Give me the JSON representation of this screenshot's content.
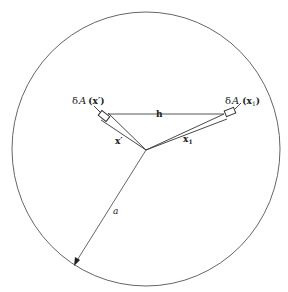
{
  "diagram": {
    "colors": {
      "stroke": "#555555",
      "text": "#222222",
      "background": "#ffffff"
    },
    "circle": {
      "cx": 146,
      "cy": 149,
      "rx": 134,
      "ry": 137
    },
    "origin": {
      "x": 146,
      "y": 150
    },
    "labels": {
      "area_left_delta": "δ",
      "area_left_A": "A",
      "area_left_arg": "(x′)",
      "area_right_delta": "δ",
      "area_right_A": "A",
      "area_right_arg_open": "(x",
      "area_right_sub": "1",
      "area_right_arg_close": ")",
      "separation": "h",
      "vector_left": "x′",
      "vector_right": "x",
      "vector_right_sub": "1",
      "radius": "a"
    }
  }
}
